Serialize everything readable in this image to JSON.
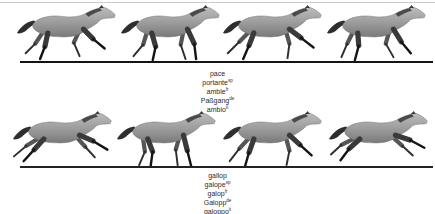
{
  "figure": {
    "frames_per_row": 4,
    "top_gait": "pace",
    "bottom_gait": "gallop"
  },
  "pace_block": {
    "head": "pace",
    "items": [
      {
        "term": "portante",
        "sup": "sp"
      },
      {
        "term": "amble",
        "sup": "fr"
      },
      {
        "term": "Paßgang",
        "sup": "de"
      },
      {
        "term": "ambio",
        "sup": "it"
      }
    ]
  },
  "gallop_block": {
    "head": "gallop",
    "items": [
      {
        "term": "galope",
        "sup": "sp"
      },
      {
        "term": "galop",
        "sup": "fr"
      },
      {
        "term": "Galopp",
        "sup": "de"
      },
      {
        "term": "galoppo",
        "sup": "it"
      }
    ]
  },
  "colors": {
    "background": "#ffffff",
    "top_hairline": "#cccccc",
    "ground_line": "#141414",
    "label_text": "#2b2b2b",
    "horse_body_light": "#bdbdbd",
    "horse_body_dark": "#7a7a7a",
    "horse_legs_dark": "#141414"
  }
}
